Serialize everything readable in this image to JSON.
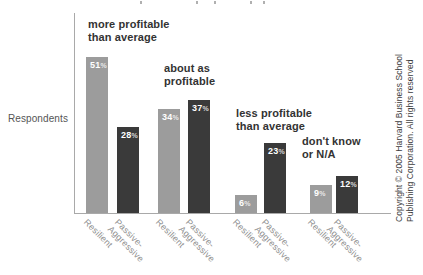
{
  "chart_data": {
    "type": "bar",
    "categories": [
      "more profitable than average",
      "about as profitable",
      "less profitable than average",
      "don't know or N/A"
    ],
    "category_annotation_lines": [
      "more profitable\nthan average",
      "about as\nprofitable",
      "less profitable\nthan average",
      "don't know\nor N/A"
    ],
    "series": [
      {
        "name": "Resilient",
        "tick_label": "Resilient",
        "color": "#9c9c9c",
        "values": [
          51,
          34,
          6,
          9
        ]
      },
      {
        "name": "Passive-Aggressive",
        "tick_label": "Passive-\nAggressive",
        "color": "#3a3a3a",
        "values": [
          28,
          37,
          23,
          12
        ]
      }
    ],
    "value_unit": "%",
    "ylabel": "Respondents",
    "ylim": [
      0,
      65
    ],
    "grid": false,
    "legend_position": "none (series named in x tick labels)"
  },
  "ylabel": "Respondents",
  "copyright": {
    "line1": "Copyright © 2005 Harvard Business School",
    "line2": "Publishing Corporation. All rights reserved"
  },
  "colors": {
    "resilient_bar": "#9c9c9c",
    "passive_aggressive_bar": "#3a3a3a",
    "axis": "#a9a9a9",
    "annotation_text": "#333333",
    "tick_text": "#8f8f8f",
    "value_text": "#ffffff"
  }
}
